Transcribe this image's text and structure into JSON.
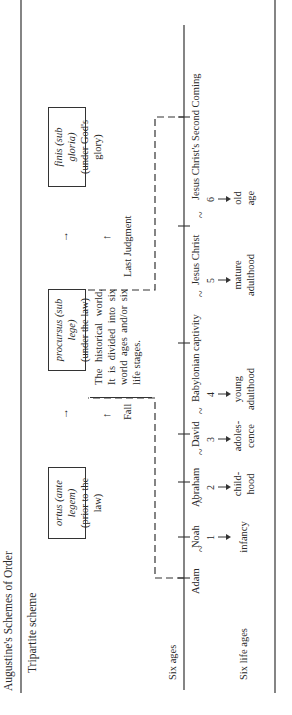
{
  "figure": {
    "title": "Augustine's Schemes of Order",
    "tripartite_label": "Tripartite scheme",
    "six_ages_label": "Six ages",
    "six_life_ages_label": "Six life ages"
  },
  "tripartite": [
    {
      "latin": "ortus (ante legem)",
      "english": "(prior to the law)"
    },
    {
      "latin": "procursus (sub lege)",
      "english": "(under the law)"
    },
    {
      "latin": "finis (sub gloria)",
      "english": "(under God's glory)"
    }
  ],
  "transition_arrow": "→",
  "up_arrow": "↑",
  "events": {
    "fall": "Fall",
    "last_judgment": "Last Judgment"
  },
  "description": {
    "lines": [
      "The historical world.",
      "It is divided into six",
      "world ages and/or six",
      "life stages."
    ]
  },
  "ages": [
    "Adam",
    "Noah",
    "Abraham",
    "David",
    "Babylonian captivity",
    "Jesus Christ",
    "Jesus Christ's Second Coming"
  ],
  "tilde": "~",
  "life_ages": [
    {
      "num": "1",
      "label": "infancy"
    },
    {
      "num": "2",
      "label": "child-hood"
    },
    {
      "num": "3",
      "label": "adoles-cence"
    },
    {
      "num": "4",
      "label": "young adulthood"
    },
    {
      "num": "5",
      "label": "mature adulthood"
    },
    {
      "num": "6",
      "label": "old age"
    }
  ],
  "colors": {
    "ink": "#2a2a2a",
    "paper": "#ffffff"
  }
}
